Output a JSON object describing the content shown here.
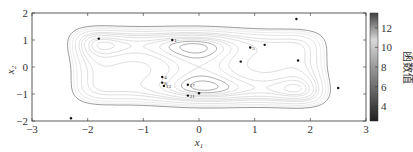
{
  "chart_data": {
    "type": "contour",
    "title": "",
    "xlabel": "x1",
    "ylabel": "x2",
    "xlim": [
      -3,
      3
    ],
    "ylim": [
      -2,
      2
    ],
    "xticks": [
      -3,
      -2,
      -1,
      0,
      1,
      2,
      3
    ],
    "yticks": [
      -2,
      -1,
      0,
      1,
      2
    ],
    "grid": false,
    "colorbar": {
      "label": "函数值",
      "range": [
        2.5,
        13.5
      ],
      "ticks": [
        4,
        6,
        8,
        10,
        12
      ],
      "colormap": "gray"
    },
    "points": [
      {
        "x": -1.8,
        "y": 1.05,
        "label": ""
      },
      {
        "x": -0.48,
        "y": 1.0,
        "label": "1"
      },
      {
        "x": 0.92,
        "y": 0.72,
        "label": "5"
      },
      {
        "x": 1.18,
        "y": 0.82,
        "label": ""
      },
      {
        "x": 0.75,
        "y": 0.2,
        "label": ""
      },
      {
        "x": 1.78,
        "y": 0.24,
        "label": ""
      },
      {
        "x": 1.75,
        "y": 1.78,
        "label": ""
      },
      {
        "x": 2.5,
        "y": -0.78,
        "label": ""
      },
      {
        "x": -2.3,
        "y": -1.9,
        "label": ""
      },
      {
        "x": -0.66,
        "y": -0.37,
        "label": "4"
      },
      {
        "x": -0.66,
        "y": -0.58,
        "label": "8"
      },
      {
        "x": -0.63,
        "y": -0.7,
        "label": "13"
      },
      {
        "x": -0.2,
        "y": -0.66,
        "label": "17"
      },
      {
        "x": -0.2,
        "y": -1.06,
        "label": "21"
      },
      {
        "x": 0.0,
        "y": -0.97,
        "label": ""
      }
    ]
  }
}
